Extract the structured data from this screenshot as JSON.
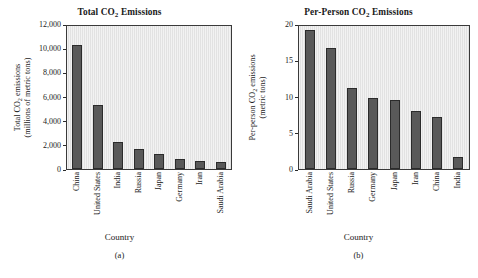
{
  "figure": {
    "background": "#ffffff",
    "bar_color": "#595959",
    "plot_background": "#e2e2e2",
    "axis_color": "#2b2b2b"
  },
  "panels": [
    {
      "id": "a",
      "caption": "(a)",
      "title_main": "Total CO",
      "title_sub": "2",
      "title_tail": " Emissions",
      "xlabel": "Country",
      "ytitle_line1_main": "Total CO",
      "ytitle_line1_sub": "2",
      "ytitle_line1_tail": " emissions",
      "ytitle_line2": "(millions of metric tons)",
      "yticks": [
        "0",
        "2,000",
        "4,000",
        "6,000",
        "8,000",
        "10,000",
        "12,000"
      ],
      "chart_data": {
        "type": "bar",
        "title": "Total CO2 Emissions",
        "xlabel": "Country",
        "ylabel": "Total CO2 emissions (millions of metric tons)",
        "ylim": [
          0,
          12000
        ],
        "ytick_values": [
          0,
          2000,
          4000,
          6000,
          8000,
          10000,
          12000
        ],
        "grid": false,
        "legend": null,
        "categories": [
          "China",
          "United States",
          "India",
          "Russia",
          "Japan",
          "Germany",
          "Iran",
          "Saudi Arabia"
        ],
        "values": [
          10400,
          5400,
          2300,
          1700,
          1300,
          800,
          680,
          620
        ]
      }
    },
    {
      "id": "b",
      "caption": "(b)",
      "title_main": "Per-Person CO",
      "title_sub": "2",
      "title_tail": " Emissions",
      "xlabel": "Country",
      "ytitle_line1_main": "Per-person CO",
      "ytitle_line1_sub": "2",
      "ytitle_line1_tail": " emissions",
      "ytitle_line2": "(metric tons)",
      "yticks": [
        "0",
        "5",
        "10",
        "15",
        "20"
      ],
      "chart_data": {
        "type": "bar",
        "title": "Per-Person CO2 Emissions",
        "xlabel": "Country",
        "ylabel": "Per-person CO2 emissions (metric tons)",
        "ylim": [
          0,
          20
        ],
        "ytick_values": [
          0,
          5,
          10,
          15,
          20
        ],
        "grid": false,
        "legend": null,
        "categories": [
          "Saudi Arabia",
          "United States",
          "Russia",
          "Germany",
          "Japan",
          "Iran",
          "China",
          "India"
        ],
        "values": [
          19.5,
          16.9,
          11.3,
          9.9,
          9.7,
          8.1,
          7.3,
          1.7
        ]
      }
    }
  ]
}
